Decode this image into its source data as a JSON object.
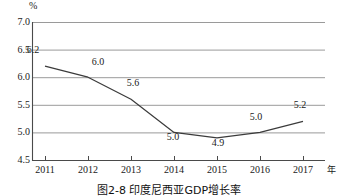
{
  "figure": {
    "caption": "图2-8  印度尼西亚GDP增长率",
    "unit_symbol": "%",
    "x_axis_unit": "年"
  },
  "chart_data": {
    "type": "line",
    "title": "图2-8  印度尼西亚GDP增长率",
    "xlabel": "年",
    "ylabel": "%",
    "categories": [
      "2011",
      "2012",
      "2013",
      "2014",
      "2015",
      "2016",
      "2017"
    ],
    "values": [
      6.2,
      6.0,
      5.6,
      5.0,
      4.9,
      5.0,
      5.2
    ],
    "point_labels": [
      "6.2",
      "6.0",
      "5.6",
      "5.0",
      "4.9",
      "5.0",
      "5.2"
    ],
    "ylim": [
      4.5,
      7.0
    ],
    "yticks": [
      "7.0",
      "6.5",
      "6.0",
      "5.5",
      "5.0",
      "4.5"
    ],
    "ytick_values": [
      7.0,
      6.5,
      6.0,
      5.5,
      5.0,
      4.5
    ],
    "grid": true,
    "legend": "none",
    "series_color": "#3b3b3b",
    "grid_color": "#9a9a9a",
    "axis_color": "#4a4a4a"
  }
}
